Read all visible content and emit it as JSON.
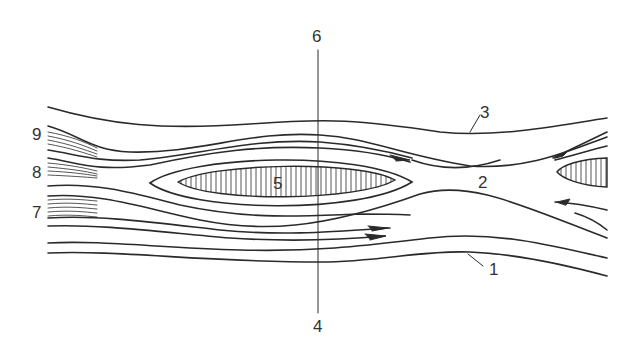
{
  "diagram": {
    "type": "streamline-flow-around-islands",
    "line_color": "#2a2a2a",
    "labels": [
      {
        "id": "1",
        "text": "1",
        "x": 489,
        "y": 261
      },
      {
        "id": "2",
        "text": "2",
        "x": 478,
        "y": 174
      },
      {
        "id": "3",
        "text": "3",
        "x": 480,
        "y": 104
      },
      {
        "id": "4",
        "text": "4",
        "x": 313,
        "y": 318
      },
      {
        "id": "5",
        "text": "5",
        "x": 273,
        "y": 175
      },
      {
        "id": "6",
        "text": "6",
        "x": 312,
        "y": 28
      },
      {
        "id": "7",
        "text": "7",
        "x": 32,
        "y": 204
      },
      {
        "id": "8",
        "text": "8",
        "x": 32,
        "y": 164
      },
      {
        "id": "9",
        "text": "9",
        "x": 32,
        "y": 126
      }
    ]
  }
}
